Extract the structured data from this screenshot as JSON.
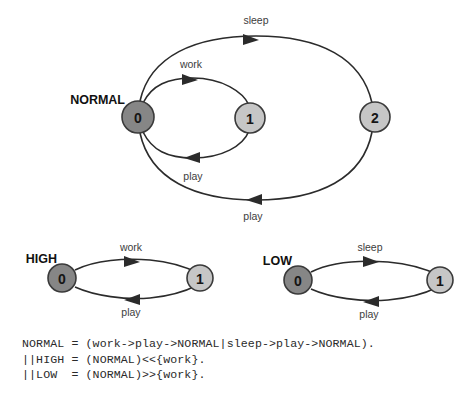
{
  "figure": {
    "type": "finite-state-process-diagram",
    "background": "#ffffff",
    "stroke_color": "#2b2b2b",
    "node_dark_fill": "#868686",
    "node_light_fill": "#c6c6c6",
    "node_outline": "#3a3a3a"
  },
  "diagrams": [
    {
      "id": "normal",
      "process_label": "NORMAL",
      "nodes": [
        {
          "id": "n0",
          "label": "0",
          "shade": "dark",
          "cx": 138,
          "cy": 117,
          "r": 16
        },
        {
          "id": "n1",
          "label": "1",
          "shade": "light",
          "cx": 250,
          "cy": 118,
          "r": 15
        },
        {
          "id": "n2",
          "label": "2",
          "shade": "light",
          "cx": 375,
          "cy": 117,
          "r": 15
        }
      ],
      "edges": [
        {
          "from": "0",
          "to": "1",
          "label": "work",
          "label_x": 191,
          "label_y": 68,
          "direction": "right"
        },
        {
          "from": "1",
          "to": "0",
          "label": "play",
          "label_x": 193,
          "label_y": 180,
          "direction": "left"
        },
        {
          "from": "0",
          "to": "2",
          "label": "sleep",
          "label_x": 256,
          "label_y": 24,
          "direction": "right"
        },
        {
          "from": "2",
          "to": "0",
          "label": "play",
          "label_x": 253,
          "label_y": 220,
          "direction": "left"
        }
      ]
    },
    {
      "id": "high",
      "process_label": "HIGH",
      "nodes": [
        {
          "id": "h0",
          "label": "0",
          "shade": "dark",
          "cx": 62,
          "cy": 278,
          "r": 14
        },
        {
          "id": "h1",
          "label": "1",
          "shade": "light",
          "cx": 200,
          "cy": 278,
          "r": 13
        }
      ],
      "edges": [
        {
          "from": "0",
          "to": "1",
          "label": "work",
          "label_x": 131,
          "label_y": 251,
          "direction": "right"
        },
        {
          "from": "1",
          "to": "0",
          "label": "play",
          "label_x": 131,
          "label_y": 312,
          "direction": "left"
        }
      ]
    },
    {
      "id": "low",
      "process_label": "LOW",
      "nodes": [
        {
          "id": "l0",
          "label": "0",
          "shade": "dark",
          "cx": 298,
          "cy": 280,
          "r": 14
        },
        {
          "id": "l1",
          "label": "1",
          "shade": "light",
          "cx": 440,
          "cy": 280,
          "r": 13
        }
      ],
      "edges": [
        {
          "from": "0",
          "to": "1",
          "label": "sleep",
          "label_x": 370,
          "label_y": 251,
          "direction": "right"
        },
        {
          "from": "1",
          "to": "0",
          "label": "play",
          "label_x": 369,
          "label_y": 314,
          "direction": "left"
        }
      ]
    }
  ],
  "code": {
    "lines": [
      "NORMAL = (work->play->NORMAL|sleep->play->NORMAL).",
      "||HIGH = (NORMAL)<<{work}.",
      "||LOW  = (NORMAL)>>{work}."
    ],
    "text": "NORMAL = (work->play->NORMAL|sleep->play->NORMAL).\n||HIGH = (NORMAL)<<{work}.\n||LOW  = (NORMAL)>>{work}."
  }
}
